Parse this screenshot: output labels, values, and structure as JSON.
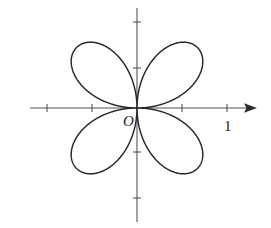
{
  "figure": {
    "name": "four-petal-polar-rose",
    "caption": "",
    "background_color": "#ffffff",
    "width": 271,
    "height": 228
  },
  "axes": {
    "origin_label": "O",
    "unit_label": "1",
    "origin_px": {
      "x": 137,
      "y": 108
    },
    "unit_px": 45,
    "axis_color": "#555555",
    "x_axis": {
      "name": "x-axis",
      "x_start": 30,
      "x_end": 257,
      "has_arrow": true,
      "ticks": [
        -2,
        -1,
        1,
        2
      ]
    },
    "y_axis": {
      "name": "y-axis",
      "y_start": 8,
      "y_end": 222,
      "has_arrow": false,
      "ticks": [
        -2.1,
        -1,
        1,
        2.1
      ]
    },
    "tick_half_length": 4
  },
  "chart_data": {
    "type": "line",
    "title": "",
    "subtitle": "",
    "xlabel": "",
    "ylabel": "",
    "curve_name": "four-petaled rose",
    "polar_equation": "r = a sin(2θ)",
    "amplitude_units": 1.9,
    "petal_count": 4,
    "petal_axis_angles_deg": [
      45,
      135,
      225,
      315
    ],
    "grid": false,
    "legend": null,
    "annotations": [
      {
        "text": "O",
        "x": -0.2,
        "y": -0.32,
        "style": "italic"
      },
      {
        "text": "1",
        "x": 2.0,
        "y": -0.35,
        "style": "normal"
      }
    ],
    "xlim": [
      -2.4,
      2.7
    ],
    "ylim": [
      -2.4,
      2.4
    ],
    "x_ticks": [
      -2,
      -1,
      1,
      2
    ],
    "y_ticks": [
      -2.1,
      -1,
      1,
      2.1
    ],
    "stroke_color": "#262626",
    "points_theta_deg_sample": [
      0,
      15,
      30,
      45,
      60,
      75,
      90,
      105,
      120,
      135,
      150,
      165,
      180,
      195,
      210,
      225,
      240,
      255,
      270,
      285,
      300,
      315,
      330,
      345,
      360
    ],
    "points_r_sample": [
      0,
      0.95,
      1.645,
      1.9,
      1.645,
      0.95,
      0,
      -0.95,
      -1.645,
      -1.9,
      -1.645,
      -0.95,
      0,
      0.95,
      1.645,
      1.9,
      1.645,
      0.95,
      0,
      -0.95,
      -1.645,
      -1.9,
      -1.645,
      -0.95,
      0
    ]
  }
}
